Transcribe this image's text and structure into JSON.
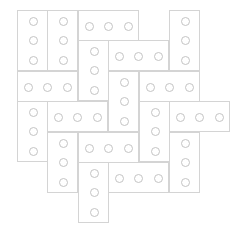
{
  "board": {
    "title": "Block puzzle board",
    "colors": {
      "outline": "#d4d4d4",
      "stud": "#c4c4c4",
      "background": "#ffffff"
    },
    "grid": {
      "columns": 7,
      "rows": 7
    },
    "pieces": [
      {
        "id": 1,
        "orientation": "vertical",
        "col": 0,
        "row": 0,
        "studs": 3
      },
      {
        "id": 2,
        "orientation": "vertical",
        "col": 1,
        "row": 0,
        "studs": 3
      },
      {
        "id": 3,
        "orientation": "horizontal",
        "col": 2,
        "row": 0,
        "studs": 3
      },
      {
        "id": 4,
        "orientation": "vertical",
        "col": 5,
        "row": 0,
        "studs": 3
      },
      {
        "id": 5,
        "orientation": "vertical",
        "col": 2,
        "row": 1,
        "studs": 3
      },
      {
        "id": 6,
        "orientation": "horizontal",
        "col": 3,
        "row": 1,
        "studs": 3
      },
      {
        "id": 7,
        "orientation": "horizontal",
        "col": 0,
        "row": 2,
        "studs": 3
      },
      {
        "id": 8,
        "orientation": "vertical",
        "col": 3,
        "row": 2,
        "studs": 3
      },
      {
        "id": 9,
        "orientation": "horizontal",
        "col": 4,
        "row": 2,
        "studs": 3
      },
      {
        "id": 10,
        "orientation": "vertical",
        "col": 0,
        "row": 3,
        "studs": 3
      },
      {
        "id": 11,
        "orientation": "horizontal",
        "col": 1,
        "row": 3,
        "studs": 3
      },
      {
        "id": 12,
        "orientation": "vertical",
        "col": 4,
        "row": 3,
        "studs": 3
      },
      {
        "id": 13,
        "orientation": "horizontal",
        "col": 5,
        "row": 3,
        "studs": 3
      },
      {
        "id": 14,
        "orientation": "vertical",
        "col": 1,
        "row": 4,
        "studs": 3
      },
      {
        "id": 15,
        "orientation": "horizontal",
        "col": 2,
        "row": 4,
        "studs": 3
      },
      {
        "id": 16,
        "orientation": "vertical",
        "col": 5,
        "row": 4,
        "studs": 3
      },
      {
        "id": 17,
        "orientation": "horizontal",
        "col": 3,
        "row": 5,
        "studs": 3
      },
      {
        "id": 18,
        "orientation": "vertical",
        "col": 2,
        "row": 5,
        "studs": 3
      }
    ]
  }
}
